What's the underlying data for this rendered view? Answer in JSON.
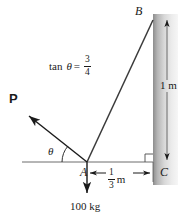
{
  "figure": {
    "type": "statics-free-body-diagram",
    "width": 184,
    "height": 221,
    "background_color": "#ffffff",
    "line_color": "#1a1a1a",
    "wall_gradient_dark": "#8d8d8d",
    "wall_gradient_light": "#f2f2f2"
  },
  "labels": {
    "point_b": "B",
    "point_a": "A",
    "point_c": "C",
    "force_p": "P",
    "angle_theta": "θ",
    "load": "100 kg"
  },
  "equation": {
    "lhs": "tan",
    "theta": "θ",
    "equals": "=",
    "numerator": "3",
    "denominator": "4"
  },
  "dimensions": {
    "horizontal": {
      "numerator": "1",
      "denominator": "3",
      "unit": "m"
    },
    "vertical": {
      "value": "1 m"
    }
  },
  "geometry": {
    "point_a": {
      "x": 87,
      "y": 162
    },
    "point_b": {
      "x": 153,
      "y": 20
    },
    "point_c": {
      "x": 153,
      "y": 162
    },
    "ground_line_start": {
      "x": 22,
      "y": 162
    },
    "force_p_tip": {
      "x": 26,
      "y": 114
    },
    "load_arrow_tip": {
      "x": 87,
      "y": 196
    },
    "wall_left": 153,
    "wall_right": 178,
    "wall_top": 14,
    "wall_bottom": 185
  }
}
